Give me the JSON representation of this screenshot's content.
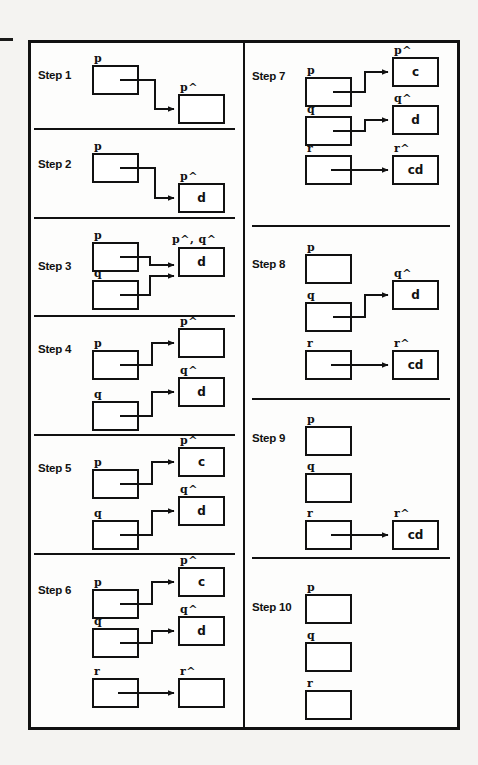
{
  "figure": {
    "type": "diagram",
    "caption_marks": {
      "edge_tick": "-"
    },
    "columns": 2,
    "step_count": 10
  },
  "labels": {
    "step1": "Step 1",
    "step2": "Step 2",
    "step3": "Step 3",
    "step4": "Step 4",
    "step5": "Step 5",
    "step6": "Step 6",
    "step7": "Step 7",
    "step8": "Step 8",
    "step9": "Step 9",
    "step10": "Step 10"
  },
  "vars": {
    "p": "p",
    "q": "q",
    "r": "r",
    "p_deref": "p^",
    "q_deref": "q^",
    "r_deref": "r^",
    "pq_deref": "p^, q^"
  },
  "values": {
    "empty": "",
    "c": "c",
    "d": "d",
    "cd": "cd"
  },
  "steps": [
    {
      "id": "step1",
      "label": "Step 1",
      "column": "left",
      "pointers": [
        {
          "name": "p",
          "target_label": "p^",
          "target_value": "",
          "arrow": "elbow-down"
        }
      ]
    },
    {
      "id": "step2",
      "label": "Step 2",
      "column": "left",
      "pointers": [
        {
          "name": "p",
          "target_label": "p^",
          "target_value": "d",
          "arrow": "elbow-down"
        }
      ]
    },
    {
      "id": "step3",
      "label": "Step 3",
      "column": "left",
      "shared_target": {
        "label": "p^, q^",
        "value": "d"
      },
      "pointers": [
        {
          "name": "p",
          "target_label": "p^, q^",
          "target_value": "d",
          "arrow": "elbow-down"
        },
        {
          "name": "q",
          "target_label": "p^, q^",
          "target_value": "d",
          "arrow": "elbow-up"
        }
      ]
    },
    {
      "id": "step4",
      "label": "Step 4",
      "column": "left",
      "pointers": [
        {
          "name": "p",
          "target_label": "p^",
          "target_value": "",
          "arrow": "elbow-up"
        },
        {
          "name": "q",
          "target_label": "q^",
          "target_value": "d",
          "arrow": "elbow-up"
        }
      ]
    },
    {
      "id": "step5",
      "label": "Step 5",
      "column": "left",
      "pointers": [
        {
          "name": "p",
          "target_label": "p^",
          "target_value": "c",
          "arrow": "elbow-up"
        },
        {
          "name": "q",
          "target_label": "q^",
          "target_value": "d",
          "arrow": "elbow-up"
        }
      ]
    },
    {
      "id": "step6",
      "label": "Step 6",
      "column": "left",
      "pointers": [
        {
          "name": "p",
          "target_label": "p^",
          "target_value": "c",
          "arrow": "elbow-up"
        },
        {
          "name": "q",
          "target_label": "q^",
          "target_value": "d",
          "arrow": "elbow-up"
        },
        {
          "name": "r",
          "target_label": "r^",
          "target_value": "",
          "arrow": "straight"
        }
      ]
    },
    {
      "id": "step7",
      "label": "Step 7",
      "column": "right",
      "pointers": [
        {
          "name": "p",
          "target_label": "p^",
          "target_value": "c",
          "arrow": "elbow-up"
        },
        {
          "name": "q",
          "target_label": "q^",
          "target_value": "d",
          "arrow": "elbow-up"
        },
        {
          "name": "r",
          "target_label": "r^",
          "target_value": "cd",
          "arrow": "straight"
        }
      ]
    },
    {
      "id": "step8",
      "label": "Step 8",
      "column": "right",
      "pointers": [
        {
          "name": "p",
          "target_label": "",
          "target_value": "",
          "arrow": "none"
        },
        {
          "name": "q",
          "target_label": "q^",
          "target_value": "d",
          "arrow": "elbow-up"
        },
        {
          "name": "r",
          "target_label": "r^",
          "target_value": "cd",
          "arrow": "straight"
        }
      ]
    },
    {
      "id": "step9",
      "label": "Step 9",
      "column": "right",
      "pointers": [
        {
          "name": "p",
          "target_label": "",
          "target_value": "",
          "arrow": "none"
        },
        {
          "name": "q",
          "target_label": "",
          "target_value": "",
          "arrow": "none"
        },
        {
          "name": "r",
          "target_label": "r^",
          "target_value": "cd",
          "arrow": "straight"
        }
      ]
    },
    {
      "id": "step10",
      "label": "Step 10",
      "column": "right",
      "pointers": [
        {
          "name": "p",
          "target_label": "",
          "target_value": "",
          "arrow": "none"
        },
        {
          "name": "q",
          "target_label": "",
          "target_value": "",
          "arrow": "none"
        },
        {
          "name": "r",
          "target_label": "",
          "target_value": "",
          "arrow": "none"
        }
      ]
    }
  ],
  "colors": {
    "ink": "#111111",
    "paper": "#fdfdfc",
    "page_background": "#f4f3f1"
  }
}
